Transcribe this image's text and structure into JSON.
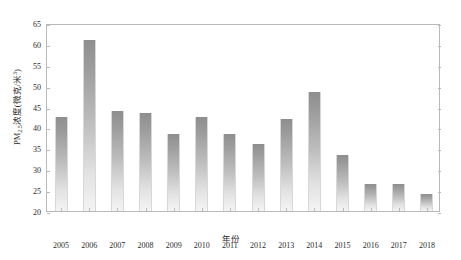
{
  "chart_data": {
    "type": "bar",
    "title": "",
    "subtitle": "",
    "xlabel": "年份",
    "ylabel": "PM2.5浓度(微克/米3)",
    "ylabel_parts": {
      "prefix": "PM",
      "sub": "2.5",
      "mid": "浓度(微克/米",
      "sup": "3",
      "suffix": ")"
    },
    "categories": [
      "2005",
      "2006",
      "2007",
      "2008",
      "2009",
      "2010",
      "2011",
      "2012",
      "2013",
      "2014",
      "2015",
      "2016",
      "2017",
      "2018"
    ],
    "values": [
      42.5,
      61,
      44,
      43.5,
      38.5,
      42.5,
      38.5,
      36,
      42,
      48.5,
      33.5,
      26.5,
      26.5,
      24
    ],
    "ylim": [
      20,
      65
    ],
    "yticks": [
      20,
      25,
      30,
      35,
      40,
      45,
      50,
      55,
      60,
      65
    ],
    "ytick_labels": [
      "20",
      "25",
      "30",
      "35",
      "40",
      "45",
      "50",
      "55",
      "60",
      "65"
    ],
    "grid": false,
    "legend": null,
    "bar_color_top": "#8e8e8e",
    "bar_color_bottom": "#f4f4f4",
    "axis_color": "#b9b9b9",
    "text_color": "#2b2b2b",
    "background": "#ffffff"
  }
}
